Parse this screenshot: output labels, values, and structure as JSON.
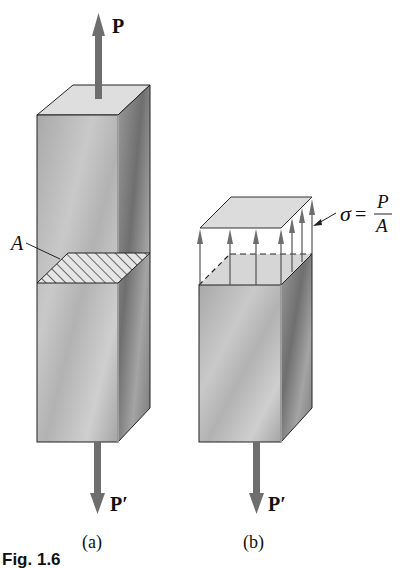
{
  "figure": {
    "caption": "Fig. 1.6",
    "panels": [
      {
        "id": "a",
        "label": "(a)",
        "top_force": "P",
        "bottom_force": "P′",
        "area_label": "A"
      },
      {
        "id": "b",
        "label": "(b)",
        "bottom_force": "P′",
        "stress_symbol": "σ",
        "stress_equals": "=",
        "stress_numerator": "P",
        "stress_denominator": "A"
      }
    ],
    "colors": {
      "arrow": "#6e6e6e",
      "face_front": "#b4b4b4",
      "face_side": "#8a8a8a",
      "face_top": "#dcdcdc",
      "outline": "#222222"
    }
  }
}
